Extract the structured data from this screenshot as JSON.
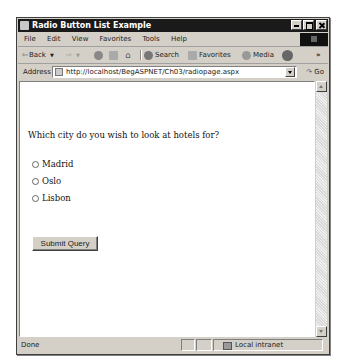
{
  "window": {
    "title": "Radio Button List Example",
    "controls": {
      "minimize": "minimize",
      "maximize": "maximize",
      "close": "close"
    }
  },
  "menubar": {
    "items": [
      "File",
      "Edit",
      "View",
      "Favorites",
      "Tools",
      "Help"
    ]
  },
  "toolbar": {
    "back": "Back",
    "search": "Search",
    "favorites": "Favorites",
    "media": "Media",
    "overflow": "»"
  },
  "address": {
    "label": "Address",
    "url": "http://localhost/BegASPNET/Ch03/radiopage.aspx",
    "go": "Go"
  },
  "page": {
    "question": "Which city do you wish to look at hotels for?",
    "options": [
      {
        "label": "Madrid",
        "checked": false
      },
      {
        "label": "Oslo",
        "checked": false
      },
      {
        "label": "Lisbon",
        "checked": false
      }
    ],
    "submit": "Submit Query"
  },
  "statusbar": {
    "status": "Done",
    "zone": "Local intranet"
  }
}
